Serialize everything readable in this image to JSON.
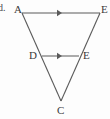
{
  "figure": {
    "item_label": "d.",
    "stroke_color": "#5a5a5a",
    "label_color": "#3a3a3a",
    "background_color": "#fdfdfd",
    "type": "geometry-triangle-midsegment",
    "vertices": [
      {
        "id": "A",
        "label": "A",
        "x": 22,
        "y": 13
      },
      {
        "id": "Etop",
        "label": "E",
        "x": 100,
        "y": 13
      },
      {
        "id": "D",
        "label": "D",
        "x": 42,
        "y": 56
      },
      {
        "id": "Emid",
        "label": "E",
        "x": 79,
        "y": 56
      },
      {
        "id": "C",
        "label": "C",
        "x": 61,
        "y": 101
      }
    ],
    "segments": [
      {
        "name": "top-segment",
        "from": "A",
        "to": "Etop",
        "tick_marks": 1
      },
      {
        "name": "mid-segment",
        "from": "D",
        "to": "Emid",
        "tick_marks": 1
      },
      {
        "name": "left-side",
        "from": "A",
        "to": "C",
        "tick_marks": 0
      },
      {
        "name": "right-side",
        "from": "Etop",
        "to": "C",
        "tick_marks": 0
      }
    ],
    "arrow_markers": [
      {
        "name": "top-arrow-marker",
        "x": 61,
        "y": 13
      },
      {
        "name": "mid-arrow-marker",
        "x": 61,
        "y": 56
      }
    ]
  }
}
